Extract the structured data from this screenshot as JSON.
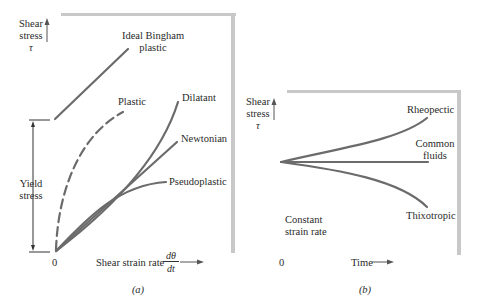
{
  "panel_a": {
    "y_label_line1": "Shear",
    "y_label_line2": "stress",
    "y_label_symbol": "τ",
    "x_label": "Shear strain rate",
    "x_label_frac_num": "dθ",
    "x_label_frac_den": "dt",
    "origin": "0",
    "yield_line1": "Yield",
    "yield_line2": "stress",
    "caption": "(a)",
    "curves": {
      "bingham_line1": "Ideal Bingham",
      "bingham_line2": "plastic",
      "plastic": "Plastic",
      "dilatant": "Dilatant",
      "newtonian": "Newtonian",
      "pseudoplastic": "Pseudoplastic"
    }
  },
  "panel_b": {
    "y_label_line1": "Shear",
    "y_label_line2": "stress",
    "y_label_symbol": "τ",
    "x_label": "Time",
    "origin": "0",
    "note_line1": "Constant",
    "note_line2": "strain rate",
    "caption": "(b)",
    "curves": {
      "rheopectic": "Rheopectic",
      "common_line1": "Common",
      "common_line2": "fluids",
      "thixotropic": "Thixotropic"
    }
  },
  "colors": {
    "curve": "#6b6b6b",
    "frame": "#c8c8c8",
    "text": "#2a2a2a"
  }
}
